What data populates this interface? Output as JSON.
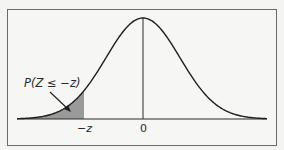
{
  "chart_data": {
    "type": "area",
    "title": "",
    "curve": "standard normal pdf",
    "shaded_region": {
      "from": "-inf",
      "to": "-z",
      "label": "P(Z ≤ −z)"
    },
    "x_tick_labels": [
      "−z",
      "0"
    ],
    "xlabel": "",
    "ylabel": "",
    "grid": false,
    "colors": {
      "curve": "#1e1e1e",
      "shade": "#9a9a9a",
      "frame": "#6a6a6a",
      "background": "#f4f4f2"
    }
  },
  "labels": {
    "annotation": "P(Z ≤ −z)",
    "tick_neg_z": "−z",
    "tick_zero": "0"
  }
}
